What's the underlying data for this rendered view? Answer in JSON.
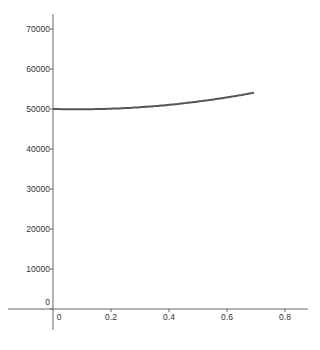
{
  "chart_data": {
    "type": "line",
    "title": "",
    "xlabel": "",
    "ylabel": "",
    "xlim": [
      -0.17,
      0.88
    ],
    "ylim": [
      -7000,
      77000
    ],
    "grid": false,
    "legend": null,
    "x_ticks": [
      "0",
      "0.2",
      "0.4",
      "0.6",
      "0.8"
    ],
    "y_ticks": [
      "0",
      "10000",
      "20000",
      "30000",
      "40000",
      "50000",
      "60000",
      "70000"
    ],
    "series": [
      {
        "name": "curve",
        "color": "#555555",
        "x": [
          0,
          0.05,
          0.1,
          0.15,
          0.2,
          0.25,
          0.3,
          0.35,
          0.4,
          0.45,
          0.5,
          0.55,
          0.6,
          0.65,
          0.693
        ],
        "y": [
          50000,
          49920,
          49930,
          49970,
          50070,
          50230,
          50440,
          50710,
          51040,
          51420,
          51860,
          52350,
          52900,
          53500,
          54060
        ]
      }
    ]
  }
}
